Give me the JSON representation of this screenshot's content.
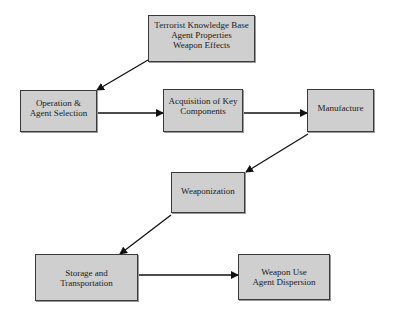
{
  "diagram": {
    "type": "flowchart",
    "nodes": [
      {
        "id": "knowledge",
        "lines": [
          "Terrorist Knowledge Base",
          "Agent Properties",
          "Weapon Effects"
        ]
      },
      {
        "id": "operation",
        "lines": [
          "Operation &",
          "Agent Selection"
        ]
      },
      {
        "id": "acquisition",
        "lines": [
          "Acquisition of Key",
          "Components"
        ]
      },
      {
        "id": "manufacture",
        "lines": [
          "Manufacture"
        ]
      },
      {
        "id": "weaponization",
        "lines": [
          "Weaponization"
        ]
      },
      {
        "id": "storage",
        "lines": [
          "Storage and",
          "Transportation"
        ]
      },
      {
        "id": "weaponuse",
        "lines": [
          "Weapon Use",
          "Agent Dispersion"
        ]
      }
    ],
    "edges": [
      {
        "from": "knowledge",
        "to": "operation"
      },
      {
        "from": "operation",
        "to": "acquisition"
      },
      {
        "from": "acquisition",
        "to": "manufacture"
      },
      {
        "from": "manufacture",
        "to": "weaponization"
      },
      {
        "from": "weaponization",
        "to": "storage"
      },
      {
        "from": "storage",
        "to": "weaponuse"
      }
    ],
    "colors": {
      "box_fill": "#cfcfcf",
      "box_border": "#3a3a3a",
      "arrow": "#111111"
    }
  }
}
